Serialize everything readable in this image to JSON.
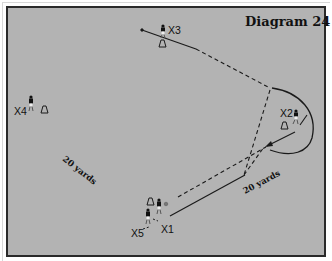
{
  "diagram": {
    "title": "Diagram 24",
    "background_color": "#b3b3b3",
    "border_color": "#2a2a2a",
    "players": [
      {
        "id": "X1",
        "label": "X1",
        "x": 158,
        "y": 207
      },
      {
        "id": "X2",
        "label": "X2",
        "x": 296,
        "y": 115
      },
      {
        "id": "X3",
        "label": "X3",
        "x": 163,
        "y": 31
      },
      {
        "id": "X4",
        "label": "X4",
        "x": 30,
        "y": 101
      },
      {
        "id": "X5",
        "label": "X5",
        "x": 147,
        "y": 217
      }
    ],
    "cones": [
      {
        "near": "X1",
        "x": 151,
        "y": 202
      },
      {
        "near": "X2",
        "x": 284,
        "y": 126
      },
      {
        "near": "X3",
        "x": 162,
        "y": 44
      },
      {
        "near": "X4",
        "x": 44,
        "y": 110
      }
    ],
    "ball": {
      "x": 166,
      "y": 204
    },
    "distance_labels": [
      {
        "text": "20 yards",
        "position": "left"
      },
      {
        "text": "20 yards",
        "position": "bottom-right"
      }
    ],
    "legend": {
      "solid_line": "player run",
      "dashed_line": "pass",
      "curved_line": "player run (curved)"
    }
  }
}
